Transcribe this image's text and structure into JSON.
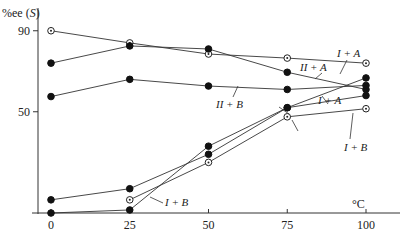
{
  "chart_data": {
    "type": "line",
    "title": "",
    "xlabel": "°C",
    "ylabel": "%ee (S)",
    "xlim": [
      0,
      100
    ],
    "ylim": [
      0,
      90
    ],
    "grid": false,
    "x_ticks": [
      0,
      25,
      50,
      75,
      100
    ],
    "x_tick_labels": [
      "0",
      "25",
      "50",
      "75",
      "100"
    ],
    "y_ticks": [
      50,
      90
    ],
    "y_tick_labels": [
      "50",
      "90"
    ],
    "x": [
      0,
      25,
      50,
      75,
      100
    ],
    "series": [
      {
        "name": "I+A",
        "marker": "open",
        "values": [
          90,
          84,
          78.5,
          76.5,
          74
        ]
      },
      {
        "name": "II+A",
        "marker": "filled",
        "values": [
          74,
          82.5,
          81,
          69.5,
          61
        ]
      },
      {
        "name": "II+B",
        "marker": "filled",
        "values": [
          57.5,
          66,
          62.7,
          61,
          63
        ]
      },
      {
        "name": "I+A",
        "marker": "filled",
        "values": [
          6.5,
          12,
          29,
          52,
          58
        ]
      },
      {
        "name": "I+B",
        "marker": "filled",
        "values": [
          0,
          1.5,
          33,
          52,
          66.7
        ]
      },
      {
        "name": "I+B",
        "marker": "open",
        "values": [
          null,
          6.5,
          25,
          47.5,
          51.5
        ]
      }
    ],
    "annotations": [
      {
        "text": "I+A",
        "near_x": 97,
        "near_y": 81
      },
      {
        "text": "II+A",
        "near_x": 85,
        "near_y": 75
      },
      {
        "text": "II+B",
        "near_x": 58,
        "near_y": 52
      },
      {
        "text": "I+A",
        "near_x": 85,
        "near_y": 58
      },
      {
        "text": "I+B",
        "near_x": 97,
        "near_y": 44
      },
      {
        "text": "I+B",
        "near_x": 35,
        "near_y": 5
      }
    ]
  }
}
